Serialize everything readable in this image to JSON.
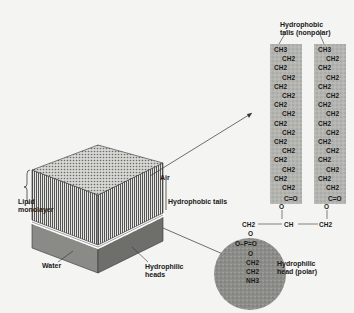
{
  "labels": {
    "air": "Air",
    "lipid_monolayer_line1": "Lipid",
    "lipid_monolayer_line2": "monolayer",
    "hydrophobic_tails": "Hydrophobic tails",
    "water": "Water",
    "hydrophilic_heads_line1": "Hydrophilic",
    "hydrophilic_heads_line2": "heads",
    "tails_nonpolar_line1": "Hydrophobic",
    "tails_nonpolar_line2": "tails (nonpolar)",
    "head_polar_line1": "Hydrophilic",
    "head_polar_line2": "head (polar)"
  },
  "molecule": {
    "chain_units": [
      "CH3",
      "CH2",
      "CH2",
      "CH2",
      "CH2",
      "CH2",
      "CH2",
      "CH2",
      "CH2",
      "CH2",
      "CH2",
      "CH2",
      "CH2",
      "CH2",
      "CH2",
      "CH2"
    ],
    "carbonyl": "C=O",
    "ester_oxygen": "O",
    "glycerol": [
      "CH2",
      "CH",
      "CH2"
    ],
    "head_groups": [
      "O",
      "O-P=O",
      "O",
      "CH2",
      "CH2",
      "NH3"
    ]
  },
  "colors": {
    "background": "#f4f4f2",
    "tail_band": "#b8b8b4",
    "head_circle": "#8e8e8a",
    "block_top": "#cfcfcb",
    "block_side": "#7a7a76",
    "water": "#9a9a96"
  }
}
